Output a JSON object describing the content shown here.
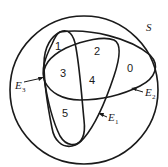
{
  "diagram": {
    "type": "venn",
    "universe_label": "S",
    "sets": [
      {
        "name": "E",
        "subscript": "1"
      },
      {
        "name": "E",
        "subscript": "2"
      },
      {
        "name": "E",
        "subscript": "3"
      }
    ],
    "regions": [
      "0",
      "1",
      "2",
      "3",
      "4",
      "5"
    ],
    "stroke_color": "#1a1a1a",
    "background_color": "#ffffff"
  }
}
